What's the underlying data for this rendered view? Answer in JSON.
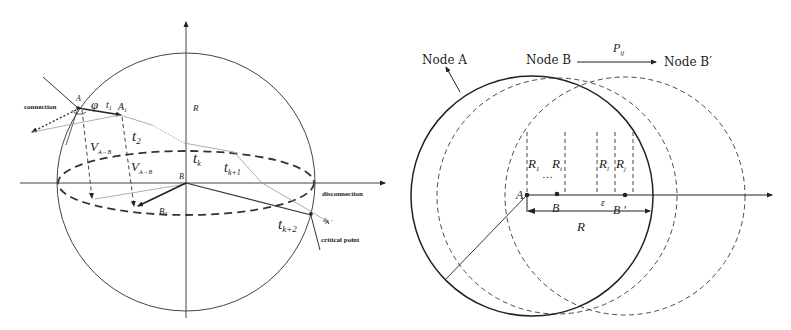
{
  "left_diagram": {
    "labels": {
      "point_a": "A",
      "connection": "connection",
      "phi": "φ",
      "t1": "t",
      "t1_sub": "1",
      "a1": "A",
      "a1_sub": "1",
      "r": "R",
      "t2": "t",
      "t2_sub": "2",
      "v_ab_1": "V",
      "v_ab_1_sub": "A→B",
      "v_ab_2": "V",
      "v_ab_2_sub": "A→B",
      "tk": "t",
      "tk_sub": "k",
      "tk1": "t",
      "tk1_sub": "k+1",
      "point_b": "B",
      "disconnection": "disconnection",
      "b1": "B",
      "b1_sub": "1",
      "tk2": "t",
      "tk2_sub": "k+2",
      "a_prime": "A '",
      "critical_point": "critical point"
    }
  },
  "right_diagram": {
    "labels": {
      "node_a": "Node  A",
      "node_b": "Node  B",
      "p_ij": "P",
      "p_ij_sub": "ij",
      "node_b_prime": "Node  B′",
      "r1": "R",
      "r1_sub": "1",
      "ri": "R",
      "ri_sub": "i",
      "rl": "R",
      "rl_sub": "l",
      "rj": "R",
      "rj_sub": "j",
      "dots": "…",
      "point_a": "A",
      "point_b": "B",
      "epsilon": "ε",
      "point_b_prime": "B ′",
      "r": "R"
    }
  },
  "colors": {
    "ink": "#222222",
    "gray_line": "#999999",
    "background": "#ffffff"
  }
}
